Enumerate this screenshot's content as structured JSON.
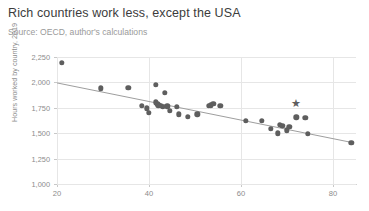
{
  "chart_data": {
    "type": "scatter",
    "title": "Rich countries work less, except the USA",
    "subtitle": "Source: OECD, author's calculations",
    "xlabel": "",
    "ylabel": "Hours worked by country, 2019",
    "xlim": [
      20,
      85
    ],
    "ylim": [
      1000,
      2250
    ],
    "xticks": [
      "20",
      "40",
      "60",
      "80"
    ],
    "xtick_values": [
      20,
      40,
      60,
      80
    ],
    "yticks": [
      "1,000",
      "1,250",
      "1,500",
      "1,750",
      "2,000",
      "2,250"
    ],
    "ytick_values": [
      1000,
      1250,
      1500,
      1750,
      2000,
      2250
    ],
    "grid": true,
    "legend": "none",
    "series": [
      {
        "name": "Countries",
        "marker": "circle",
        "color": "#5e5e5e",
        "points": [
          [
            21.0,
            2195
          ],
          [
            29.5,
            1940
          ],
          [
            35.5,
            1945
          ],
          [
            41.5,
            1975
          ],
          [
            43.5,
            1900
          ],
          [
            38.5,
            1770
          ],
          [
            39.5,
            1745
          ],
          [
            41.5,
            1805
          ],
          [
            41.8,
            1790
          ],
          [
            42.0,
            1775
          ],
          [
            42.5,
            1770
          ],
          [
            43.0,
            1760
          ],
          [
            44.0,
            1765
          ],
          [
            40.0,
            1700
          ],
          [
            44.5,
            1720
          ],
          [
            46.0,
            1760
          ],
          [
            46.5,
            1685
          ],
          [
            48.5,
            1660
          ],
          [
            50.5,
            1685
          ],
          [
            53.0,
            1770
          ],
          [
            53.5,
            1775
          ],
          [
            54.0,
            1790
          ],
          [
            55.5,
            1770
          ],
          [
            61.0,
            1620
          ],
          [
            64.5,
            1620
          ],
          [
            66.5,
            1545
          ],
          [
            68.5,
            1585
          ],
          [
            69.0,
            1575
          ],
          [
            68.0,
            1500
          ],
          [
            70.0,
            1530
          ],
          [
            70.5,
            1560
          ],
          [
            72.0,
            1655
          ],
          [
            74.0,
            1650
          ],
          [
            74.5,
            1495
          ],
          [
            84.0,
            1405
          ]
        ]
      },
      {
        "name": "United States",
        "marker": "star",
        "color": "#5e5e5e",
        "points": [
          [
            72.0,
            1800
          ]
        ]
      }
    ],
    "trendline": {
      "name": "Linear fit",
      "color": "#9e9e9e",
      "x_start": 20,
      "y_start": 1995,
      "x_end": 84.5,
      "y_end": 1405
    },
    "colors": {
      "marker": "#5e5e5e",
      "trendline": "#9e9e9e",
      "grid": "#e6e6e6",
      "axis": "#d2d2d2",
      "title_text": "#3c3c3c",
      "subtitle_text": "#9a9a9a",
      "tick_text": "#8c8c8c",
      "background": "#ffffff"
    }
  }
}
